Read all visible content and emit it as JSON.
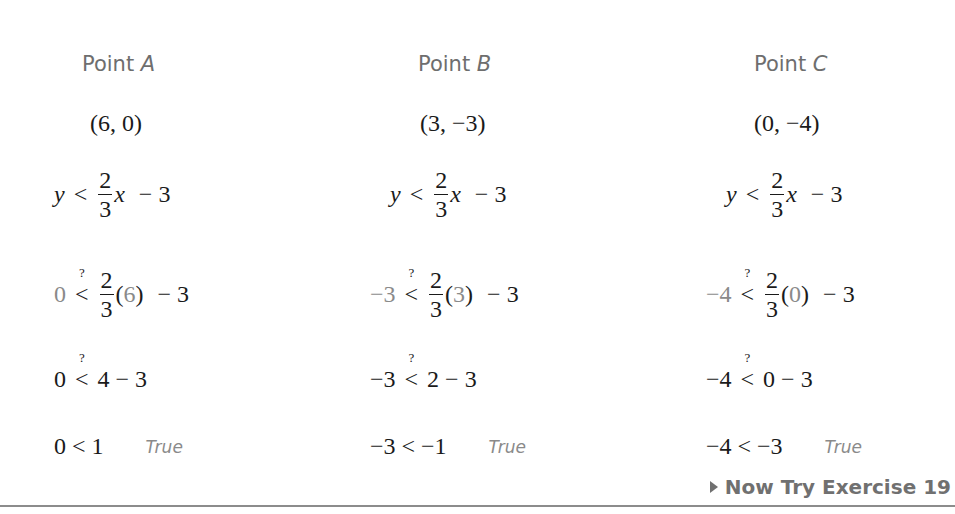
{
  "columns": [
    {
      "heading_prefix": "Point ",
      "heading_letter": "A",
      "point": "(6, 0)",
      "inequality": {
        "lhs": "y",
        "rel": "<",
        "num": "2",
        "den": "3",
        "var": "x",
        "rest": "− 3"
      },
      "substitute": {
        "lhs": "0",
        "num": "2",
        "den": "3",
        "arg": "6",
        "rest": "− 3"
      },
      "simplify": {
        "lhs": "0",
        "rhs": "4 − 3"
      },
      "result": {
        "text": "0 < 1",
        "verdict": "True"
      }
    },
    {
      "heading_prefix": "Point ",
      "heading_letter": "B",
      "point": "(3, −3)",
      "inequality": {
        "lhs": "y",
        "rel": "<",
        "num": "2",
        "den": "3",
        "var": "x",
        "rest": "− 3"
      },
      "substitute": {
        "lhs": "−3",
        "num": "2",
        "den": "3",
        "arg": "3",
        "rest": "− 3"
      },
      "simplify": {
        "lhs": "−3",
        "rhs": "2 − 3"
      },
      "result": {
        "text": "−3 < −1",
        "verdict": "True"
      }
    },
    {
      "heading_prefix": "Point ",
      "heading_letter": "C",
      "point": "(0, −4)",
      "inequality": {
        "lhs": "y",
        "rel": "<",
        "num": "2",
        "den": "3",
        "var": "x",
        "rest": "− 3"
      },
      "substitute": {
        "lhs": "−4",
        "num": "2",
        "den": "3",
        "arg": "0",
        "rest": "− 3"
      },
      "simplify": {
        "lhs": "−4",
        "rhs": "0 − 3"
      },
      "result": {
        "text": "−4 < −3",
        "verdict": "True"
      }
    }
  ],
  "symbols": {
    "lt": "<",
    "question": "?",
    "lparen": "(",
    "rparen": ")"
  },
  "footer": {
    "link_label": "Now Try Exercise 19"
  }
}
